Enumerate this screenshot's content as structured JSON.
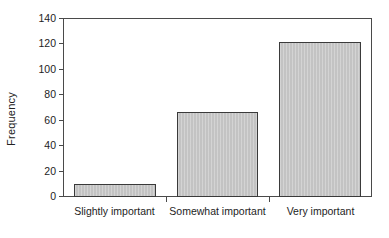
{
  "chart_data": {
    "type": "bar",
    "title": "",
    "subtitle": "",
    "xlabel": "",
    "ylabel": "Frequency",
    "categories": [
      "Slightly important",
      "Somewhat important",
      "Very important"
    ],
    "values": [
      10,
      67,
      122
    ],
    "series": [
      {
        "name": "Frequency",
        "values": [
          10,
          67,
          122
        ]
      }
    ],
    "ylim": [
      0,
      140
    ],
    "yticks": [
      0,
      20,
      40,
      60,
      80,
      100,
      120,
      140
    ],
    "ytick_labels": [
      "0",
      "20",
      "40",
      "60",
      "80",
      "100",
      "120",
      "140"
    ],
    "xtick_labels": [
      "Slightly important",
      "Somewhat important",
      "Very important"
    ],
    "grid": false,
    "legend": false,
    "legend_position": "none",
    "annotations": [],
    "bar_fill_color": "#c3c3c3",
    "bar_border_color": "#3a3a3a",
    "axis_color": "#4a4a4a",
    "text_color": "#1d1d1d",
    "background_color": "#ffffff"
  }
}
